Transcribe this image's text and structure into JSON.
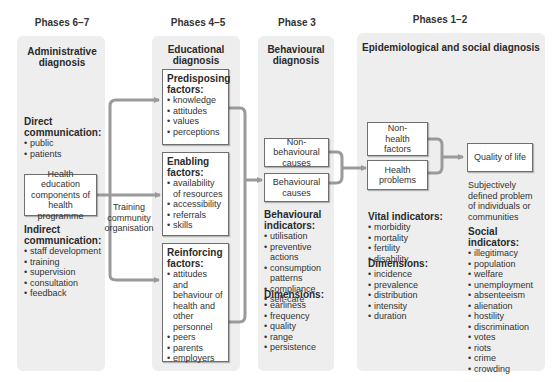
{
  "phases": {
    "p67": "Phases 6–7",
    "p45": "Phases 4–5",
    "p3": "Phase 3",
    "p12": "Phases 1–2"
  },
  "administrative": {
    "title": "Administrative diagnosis",
    "direct_heading": "Direct communication:",
    "direct_items": [
      "public",
      "patients"
    ],
    "central_box": "Health education components of health programme",
    "indirect_heading": "Indirect communication:",
    "indirect_items": [
      "staff development",
      "training",
      "supervision",
      "consultation",
      "feedback"
    ],
    "training_label": "Training community organisation"
  },
  "educational": {
    "title": "Educational diagnosis",
    "predisposing": {
      "heading": "Predisposing factors:",
      "items": [
        "knowledge",
        "attitudes",
        "values",
        "perceptions"
      ]
    },
    "enabling": {
      "heading": "Enabling factors:",
      "items": [
        "availability of resources",
        "accessibility",
        "referrals",
        "skills"
      ]
    },
    "reinforcing": {
      "heading": "Reinforcing factors:",
      "items": [
        "attitudes and behaviour of health and other personnel",
        "peers",
        "parents",
        "employers"
      ]
    }
  },
  "behavioural": {
    "title": "Behavioural diagnosis",
    "non_behavioural_box": "Non-behavioural causes",
    "behavioural_box": "Behavioural causes",
    "indicators_heading": "Behavioural indicators:",
    "indicators": [
      "utilisation",
      "preventive actions",
      "consumption patterns",
      "compliance",
      "self-care"
    ],
    "dimensions_heading": "Dimensions:",
    "dimensions": [
      "earliness",
      "frequency",
      "quality",
      "range",
      "persistence"
    ]
  },
  "epidemiological": {
    "title": "Epidemiological and social diagnosis",
    "non_health_box": "Non-health factors",
    "health_box": "Health problems",
    "quality_box": "Quality of life",
    "quality_desc": "Subjectively defined problem of individuals or communities",
    "vital_heading": "Vital indicators:",
    "vital_items": [
      "morbidity",
      "mortality",
      "fertility",
      "disability"
    ],
    "dimensions_heading": "Dimensions:",
    "dimensions": [
      "incidence",
      "prevalence",
      "distribution",
      "intensity",
      "duration"
    ],
    "social_heading": "Social indicators:",
    "social_items": [
      "illegitimacy",
      "population",
      "welfare",
      "unemployment",
      "absenteeism",
      "alienation",
      "hostility",
      "discrimination",
      "votes",
      "riots",
      "crime",
      "crowding"
    ]
  },
  "colors": {
    "panel_bg": "#eeeeee",
    "connector": "#9a9a9a",
    "box_border": "#6f6f6f"
  }
}
